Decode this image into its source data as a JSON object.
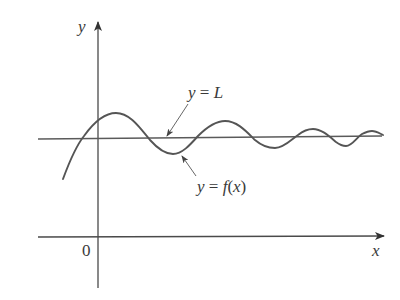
{
  "diagram": {
    "axes": {
      "y_label": "y",
      "x_label": "x",
      "origin_label": "0"
    },
    "labels": {
      "asymptote": {
        "lhs": "y",
        "eq": " = ",
        "rhs": "L"
      },
      "function": {
        "lhs": "y",
        "eq": " = ",
        "f": "f",
        "open": "(",
        "arg": "x",
        "close": ")"
      }
    },
    "colors": {
      "ink": "#4a4a4a",
      "curve": "#555555",
      "background": "#ffffff"
    }
  }
}
